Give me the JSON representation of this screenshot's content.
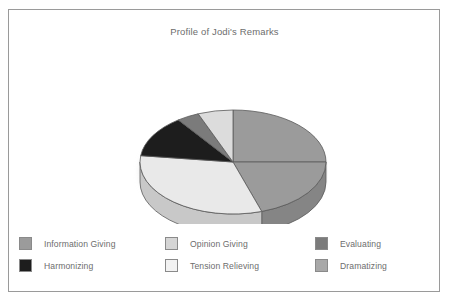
{
  "chart_data": {
    "type": "pie",
    "title": "Profile of Jodi's Remarks",
    "xlabel": "",
    "ylabel": "",
    "legend_position": "bottom",
    "grid": false,
    "three_d": true,
    "start_angle_deg": 0,
    "direction": "clockwise",
    "categories": [
      "Information Giving",
      "Dramatizing",
      "Opinion Giving",
      "Harmonizing",
      "Evaluating",
      "Tension Relieving"
    ],
    "values": [
      25,
      20,
      32,
      13,
      4,
      6
    ],
    "slices": [
      {
        "label": "Information Giving",
        "value": 25,
        "percent": 25,
        "color": "#9b9b9b",
        "start_deg": 0,
        "end_deg": 90
      },
      {
        "label": "Dramatizing",
        "value": 20,
        "percent": 20,
        "color": "#9b9b9b",
        "start_deg": 90,
        "end_deg": 162
      },
      {
        "label": "Opinion Giving",
        "value": 32,
        "percent": 32,
        "color": "#e9e9e9",
        "start_deg": 162,
        "end_deg": 277
      },
      {
        "label": "Harmonizing",
        "value": 13,
        "percent": 13,
        "color": "#1d1d1d",
        "start_deg": 277,
        "end_deg": 324
      },
      {
        "label": "Evaluating",
        "value": 4,
        "percent": 4,
        "color": "#7b7b7b",
        "start_deg": 324,
        "end_deg": 338
      },
      {
        "label": "Tension Relieving",
        "value": 6,
        "percent": 6,
        "color": "#dcdcdc",
        "start_deg": 338,
        "end_deg": 360
      }
    ]
  },
  "title": {
    "text": "Profile of Jodi's Remarks"
  },
  "legend": {
    "rows": [
      {
        "items": [
          {
            "label": "Information Giving",
            "color": "#9b9b9b"
          },
          {
            "label": "Opinion Giving",
            "color": "#d5d5d5"
          },
          {
            "label": "Evaluating",
            "color": "#7b7b7b"
          }
        ]
      },
      {
        "items": [
          {
            "label": "Harmonizing",
            "color": "#1d1d1d"
          },
          {
            "label": "Tension Relieving",
            "color": "#f2f2f2"
          },
          {
            "label": "Dramatizing",
            "color": "#a8a8a8"
          }
        ]
      }
    ]
  },
  "colors": {
    "frame_border": "#9a9a9a",
    "text": "#6d6d6d",
    "background": "#ffffff",
    "slice_outline": "#5a5a5a"
  }
}
